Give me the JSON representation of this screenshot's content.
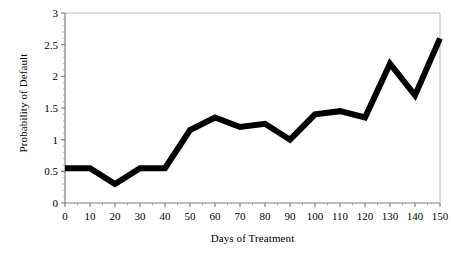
{
  "chart_data": {
    "type": "line",
    "title": "",
    "subtitle": "",
    "xlabel": "Days of Treatment",
    "ylabel": "Probability of Default",
    "x": [
      0,
      10,
      20,
      30,
      40,
      50,
      60,
      70,
      80,
      90,
      100,
      110,
      120,
      130,
      140,
      150
    ],
    "values": [
      0.55,
      0.55,
      0.3,
      0.55,
      0.55,
      1.15,
      1.35,
      1.2,
      1.25,
      1.0,
      1.4,
      1.45,
      1.35,
      2.2,
      1.7,
      2.6
    ],
    "series": [
      {
        "name": "Probability of Default",
        "values": [
          0.55,
          0.55,
          0.3,
          0.55,
          0.55,
          1.15,
          1.35,
          1.2,
          1.25,
          1.0,
          1.4,
          1.45,
          1.35,
          2.2,
          1.7,
          2.6
        ]
      }
    ],
    "xlim": [
      0,
      150
    ],
    "ylim": [
      0,
      3
    ],
    "xticks": [
      0,
      10,
      20,
      30,
      40,
      50,
      60,
      70,
      80,
      90,
      100,
      110,
      120,
      130,
      140,
      150
    ],
    "yticks": [
      0,
      0.5,
      1,
      1.5,
      2,
      2.5,
      3
    ],
    "xtick_labels": [
      "0",
      "10",
      "20",
      "30",
      "40",
      "50",
      "60",
      "70",
      "80",
      "90",
      "100",
      "110",
      "120",
      "130",
      "140",
      "150"
    ],
    "ytick_labels": [
      "0",
      "0.5",
      "1",
      "1.5",
      "2",
      "2.5",
      "3"
    ],
    "grid": false,
    "legend": false,
    "legend_position": "none",
    "line_color": "#000000",
    "line_width": 6,
    "axis_color": "#808080",
    "background_color": "#ffffff",
    "minor_ticks": true
  },
  "axes": {
    "y_title": "Probability of Default",
    "x_title": "Days of Treatment"
  }
}
